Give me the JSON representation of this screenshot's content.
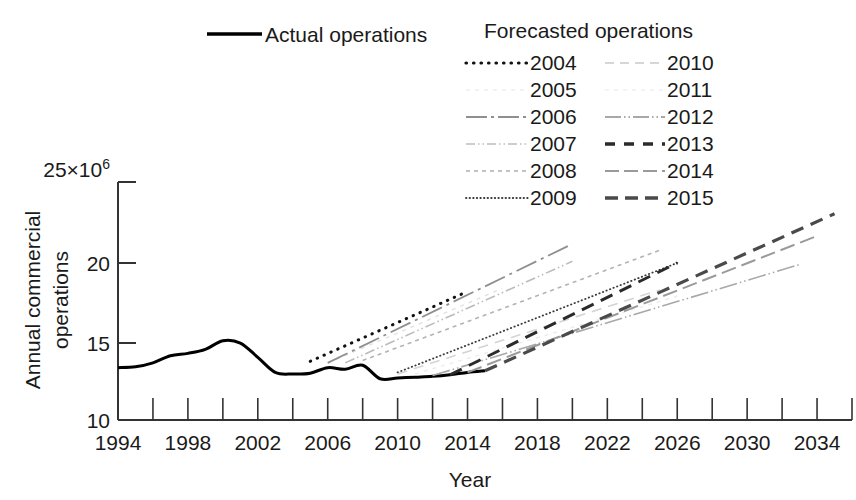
{
  "chart_data": {
    "type": "line",
    "title": "",
    "xlabel": "Year",
    "ylabel_line1": "Annual commercial",
    "ylabel_line2": "operations",
    "y_exponent_label": "25×10⁶",
    "y_multiplier": "×10⁶",
    "xlim": [
      1994,
      2036
    ],
    "ylim": [
      10,
      25
    ],
    "grid": false,
    "x_ticks_major": [
      1994,
      1998,
      2002,
      2006,
      2010,
      2014,
      2018,
      2022,
      2026,
      2030,
      2034
    ],
    "x_ticks_minor": [
      1996,
      2000,
      2004,
      2008,
      2012,
      2016,
      2020,
      2024,
      2028,
      2032,
      2036
    ],
    "y_ticks": [
      10,
      15,
      20,
      25
    ],
    "y_tick_labels": [
      "10",
      "15",
      "20",
      "25"
    ],
    "legend_position": "top",
    "legend_title_actual": "Actual operations",
    "legend_title_forecast": "Forecasted operations",
    "series": [
      {
        "name": "Actual operations",
        "style": "solid-bold",
        "color": "#000000",
        "width": 3.0,
        "x": [
          1994,
          1995,
          1996,
          1997,
          1998,
          1999,
          2000,
          2001,
          2002,
          2003,
          2004,
          2005,
          2006,
          2007,
          2008,
          2009,
          2010,
          2011,
          2012,
          2013,
          2014,
          2015
        ],
        "y": [
          13.3,
          13.35,
          13.6,
          14.05,
          14.2,
          14.45,
          15.0,
          14.85,
          13.95,
          13.0,
          12.9,
          12.95,
          13.3,
          13.2,
          13.45,
          12.6,
          12.65,
          12.7,
          12.75,
          12.85,
          13.0,
          13.1
        ]
      },
      {
        "name": "2004",
        "style": "dotted-bold",
        "color": "#111111",
        "width": 3.0,
        "x": [
          2005,
          2014
        ],
        "y": [
          13.7,
          18.1
        ]
      },
      {
        "name": "2005",
        "style": "very-light",
        "color": "#e2e2e2",
        "width": 1.4,
        "x": [
          2006,
          2016
        ],
        "y": [
          13.6,
          18.3
        ]
      },
      {
        "name": "2006",
        "style": "dash-dot",
        "color": "#8f8f8f",
        "width": 1.8,
        "x": [
          2006,
          2020
        ],
        "y": [
          13.6,
          21.1
        ]
      },
      {
        "name": "2007",
        "style": "dash-dot-dot",
        "color": "#bbbbbb",
        "width": 1.6,
        "x": [
          2007,
          2020
        ],
        "y": [
          13.6,
          20.0
        ]
      },
      {
        "name": "2008",
        "style": "dash-short",
        "color": "#b3b3b3",
        "width": 1.6,
        "x": [
          2008,
          2025
        ],
        "y": [
          13.75,
          20.7
        ]
      },
      {
        "name": "2009",
        "style": "dotted-fine",
        "color": "#3a3a3a",
        "width": 1.8,
        "x": [
          2010,
          2026
        ],
        "y": [
          13.0,
          19.9
        ]
      },
      {
        "name": "2010",
        "style": "dash-light",
        "color": "#d4d4d4",
        "width": 1.6,
        "x": [
          2010,
          2025
        ],
        "y": [
          12.9,
          18.2
        ]
      },
      {
        "name": "2011",
        "style": "very-light",
        "color": "#ececec",
        "width": 1.4,
        "x": [
          2011,
          2026
        ],
        "y": [
          12.9,
          17.8
        ]
      },
      {
        "name": "2012",
        "style": "dash-dot-long",
        "color": "#a8a8a8",
        "width": 1.6,
        "x": [
          2012,
          2033
        ],
        "y": [
          12.8,
          19.8
        ]
      },
      {
        "name": "2013",
        "style": "dash-bold",
        "color": "#2b2b2b",
        "width": 3.0,
        "x": [
          2013,
          2026
        ],
        "y": [
          12.85,
          19.9
        ]
      },
      {
        "name": "2014",
        "style": "dash-medium",
        "color": "#9a9a9a",
        "width": 2.0,
        "x": [
          2014,
          2034
        ],
        "y": [
          13.0,
          21.6
        ]
      },
      {
        "name": "2015",
        "style": "dash-bold",
        "color": "#4a4a4a",
        "width": 3.2,
        "x": [
          2015,
          2035
        ],
        "y": [
          13.1,
          23.0
        ]
      }
    ],
    "legend_left_column": [
      "2004",
      "2005",
      "2006",
      "2007",
      "2008",
      "2009"
    ],
    "legend_right_column": [
      "2010",
      "2011",
      "2012",
      "2013",
      "2014",
      "2015"
    ]
  }
}
